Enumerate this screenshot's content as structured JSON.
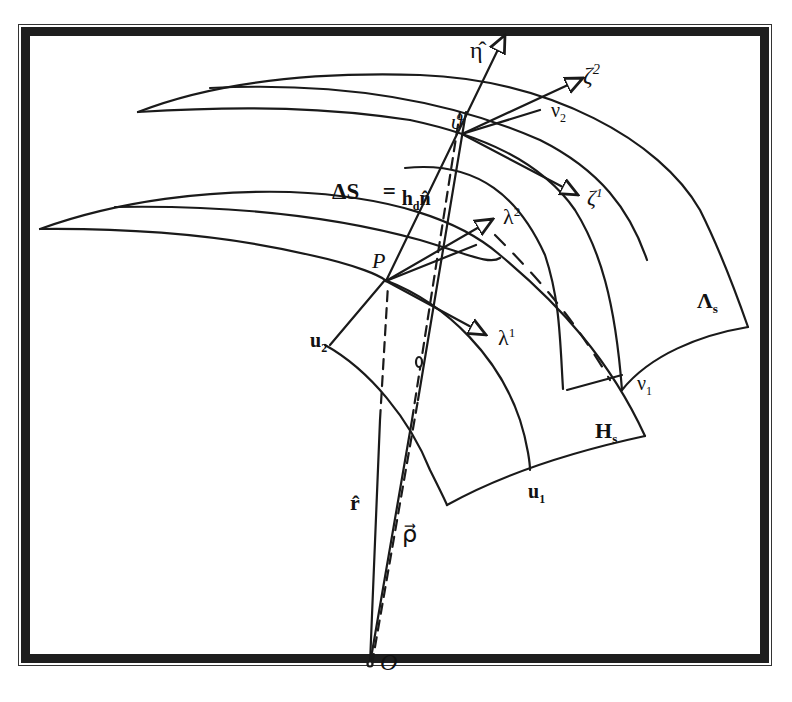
{
  "diagram": {
    "colors": {
      "ink": "#1a1a1a",
      "frame": "#1e1e1e",
      "background": "#ffffff"
    },
    "labels": {
      "eta_hat": "η̂",
      "zeta2_base": "ζ",
      "zeta2_sup": "2",
      "zeta1_base": "ζ",
      "zeta1_sup": "1",
      "nu2_base": "ν",
      "nu2_sub": "2",
      "nu1_base": "ν",
      "nu1_sub": "1",
      "theta_point": "ϑ",
      "delta_s_lhs": "ΔS⃗ =",
      "delta_s_h": "h",
      "delta_s_h_sub": "d",
      "delta_s_n": "n̂",
      "lambda2_base": "λ",
      "lambda2_sup": "2",
      "lambda1_base": "λ",
      "lambda1_sup": "1",
      "point_p": "P",
      "u2_base": "u",
      "u2_sub": "2",
      "u1_base": "u",
      "u1_sub": "1",
      "lambda_s_base": "Λ",
      "lambda_s_sub": "s",
      "h_s_base": "H",
      "h_s_sub": "s",
      "r_vec": "r̂",
      "rho_vec": "ρ⃗",
      "origin": "O"
    }
  }
}
